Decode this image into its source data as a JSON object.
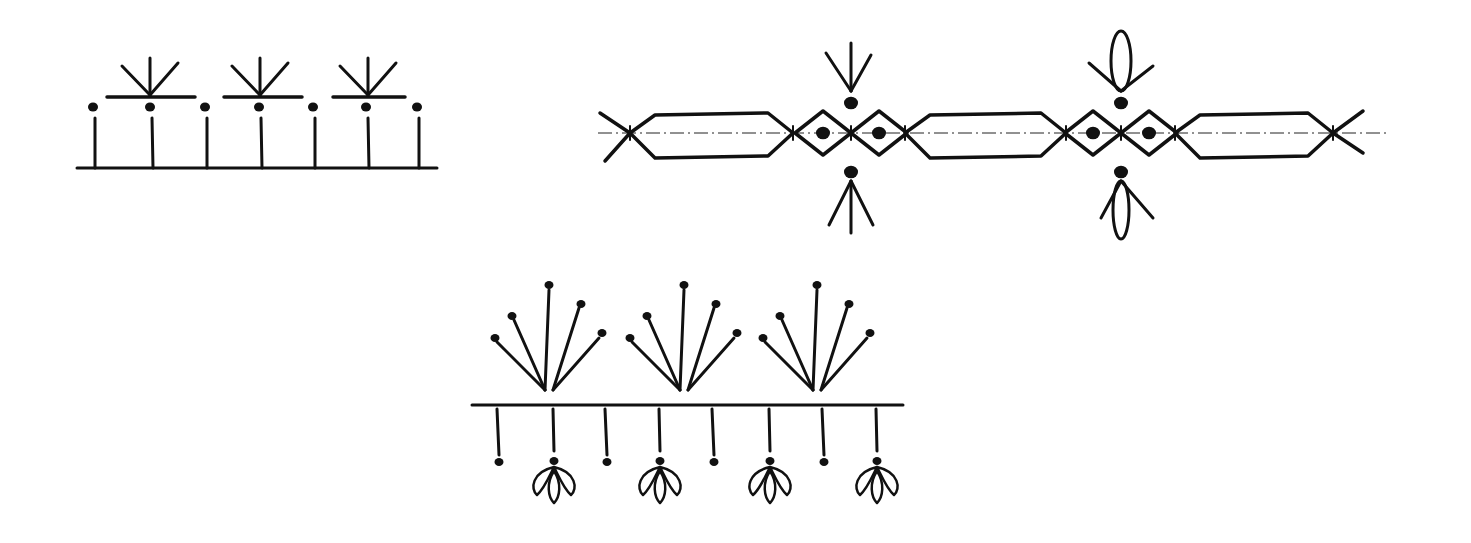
{
  "figure": {
    "background": "#ffffff",
    "ink_color": "#111111"
  },
  "drawings": [
    {
      "id": "pattern-1",
      "name": "Picot fan border on straight base line",
      "baseline": {
        "x1": 77,
        "x2": 437,
        "y": 168
      },
      "stems": [
        95,
        152,
        207,
        261,
        315,
        368,
        419
      ],
      "stem_top_y": 118,
      "dot_y": 107,
      "bars": [
        [
          107,
          195
        ],
        [
          224,
          302
        ],
        [
          333,
          405
        ]
      ],
      "bar_y": 97,
      "fan_centers": [
        150,
        260,
        368
      ]
    },
    {
      "id": "pattern-2",
      "name": "Hexagon and diamond chain on dash-dot center line",
      "center_line": {
        "x1": 598,
        "x2": 1390,
        "y": 133
      },
      "hexagons": [
        [
          630,
          793
        ],
        [
          905,
          1066
        ],
        [
          1175,
          1333
        ]
      ],
      "diamond_groups": [
        {
          "center": 851,
          "top_motif": "arrow-fan",
          "bottom_motif": "arrow-fan"
        },
        {
          "center": 1121,
          "top_motif": "loop-fan",
          "bottom_motif": "loop-fan"
        }
      ]
    },
    {
      "id": "pattern-3",
      "name": "Dotted fan clusters with pendant flower drops",
      "baseline": {
        "x1": 472,
        "x2": 903,
        "y": 405
      },
      "fan_centers": [
        549,
        684,
        817
      ],
      "pendants": [
        {
          "x": 497,
          "type": "dot"
        },
        {
          "x": 553,
          "type": "flower"
        },
        {
          "x": 605,
          "type": "dot"
        },
        {
          "x": 659,
          "type": "flower"
        },
        {
          "x": 712,
          "type": "dot"
        },
        {
          "x": 769,
          "type": "flower"
        },
        {
          "x": 822,
          "type": "dot"
        },
        {
          "x": 876,
          "type": "flower"
        }
      ]
    }
  ]
}
